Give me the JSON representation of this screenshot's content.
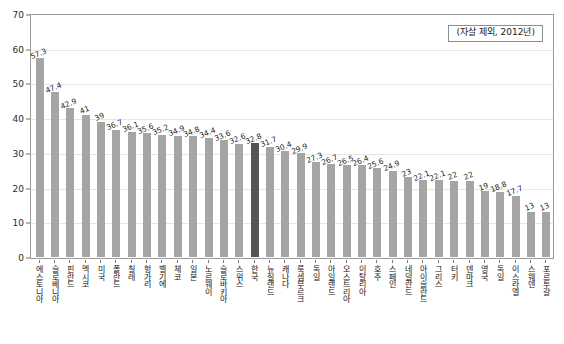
{
  "annotation": {
    "text": "(자살 제외, 2012년)"
  },
  "axis": {
    "y_ticks": [
      "0",
      "10",
      "20",
      "30",
      "40",
      "50",
      "60",
      "70"
    ]
  },
  "colors": {
    "bar": "#a5a5a5",
    "bar_highlight": "#555555",
    "grid": "#e6e6e6",
    "frame": "#9b9b9b",
    "text": "#1f1f1f"
  },
  "chart_data": {
    "type": "bar",
    "title": "",
    "subtitle": "",
    "xlabel": "",
    "ylabel": "",
    "ylim": [
      0,
      70
    ],
    "grid": true,
    "legend": "none",
    "annotations": [
      "(자살 제외, 2012년)"
    ],
    "highlight_category": "한국",
    "categories": [
      "에스토니아",
      "슬로베니아",
      "핀란드",
      "멕시코",
      "미국",
      "폴란드",
      "칠레",
      "헝가리",
      "벨기에",
      "체코",
      "일본",
      "노르웨이",
      "슬로바키아",
      "스위스",
      "한국",
      "뉴질랜드",
      "캐나다",
      "룩셈부르크",
      "독일",
      "아일랜드",
      "오스트리아",
      "이탈리아",
      "호주",
      "스페인",
      "네덜란드",
      "아이슬란드",
      "그리스",
      "터키",
      "덴마크",
      "영국",
      "독일",
      "이스라엘",
      "스웨덴",
      "포르투갈"
    ],
    "values": [
      57.3,
      47.4,
      42.9,
      41,
      39,
      36.7,
      36.1,
      35.6,
      35.2,
      34.9,
      34.8,
      34.4,
      33.6,
      32.6,
      32.8,
      31.7,
      30.4,
      29.9,
      27.3,
      26.7,
      26.5,
      26.4,
      25.6,
      24.9,
      23,
      22.1,
      22.1,
      22,
      22,
      19,
      18.8,
      17.7,
      13,
      13
    ],
    "value_labels": [
      "57.3",
      "47.4",
      "42.9",
      "41",
      "39",
      "36.7",
      "36.1",
      "35.6",
      "35.2",
      "34.9",
      "34.8",
      "34.4",
      "33.6",
      "32.6",
      "32.8",
      "31.7",
      "30.4",
      "29.9",
      "27.3",
      "26.7",
      "26.5",
      "26.4",
      "25.6",
      "24.9",
      "23",
      "22.1",
      "22.1",
      "22",
      "22",
      "19",
      "18.8",
      "17.7",
      "13",
      "13"
    ]
  }
}
